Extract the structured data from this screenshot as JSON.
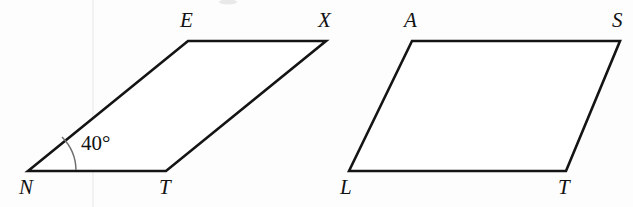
{
  "figure": {
    "background_color": "#fdfdfd",
    "stroke_color": "#141414",
    "arc_color": "#6f6f6f",
    "label_color": "#121212",
    "width": 633,
    "height": 207
  },
  "shapes": [
    {
      "id": "left-parallelogram",
      "name": "parallelogram-netx",
      "vertices": [
        {
          "label": "N",
          "x": 28,
          "y": 171
        },
        {
          "label": "E",
          "x": 188,
          "y": 41
        },
        {
          "label": "X",
          "x": 326,
          "y": 41
        },
        {
          "label": "T",
          "x": 166,
          "y": 171
        }
      ],
      "labels": [
        {
          "label": "N",
          "x": 19,
          "y": 177
        },
        {
          "label": "E",
          "x": 180,
          "y": 10
        },
        {
          "label": "X",
          "x": 318,
          "y": 10
        },
        {
          "label": "T",
          "x": 159,
          "y": 177
        }
      ],
      "angle": {
        "at_vertex": "N",
        "text": "40°",
        "text_x": 81,
        "text_y": 133,
        "arc_radius": 48,
        "arc_start_x": 76,
        "arc_start_y": 170,
        "arc_end_x": 62,
        "arc_end_y": 137
      }
    },
    {
      "id": "right-parallelogram",
      "name": "parallelogram-lats",
      "vertices": [
        {
          "label": "L",
          "x": 349,
          "y": 171
        },
        {
          "label": "A",
          "x": 412,
          "y": 41
        },
        {
          "label": "S",
          "x": 620,
          "y": 41
        },
        {
          "label": "T",
          "x": 566,
          "y": 171
        }
      ],
      "labels": [
        {
          "label": "L",
          "x": 340,
          "y": 177
        },
        {
          "label": "A",
          "x": 404,
          "y": 10
        },
        {
          "label": "S",
          "x": 612,
          "y": 10
        },
        {
          "label": "T",
          "x": 558,
          "y": 177
        }
      ]
    }
  ],
  "artifacts": {
    "scan_line_x": 93,
    "smudge_x": 228,
    "smudge_y": 2
  }
}
